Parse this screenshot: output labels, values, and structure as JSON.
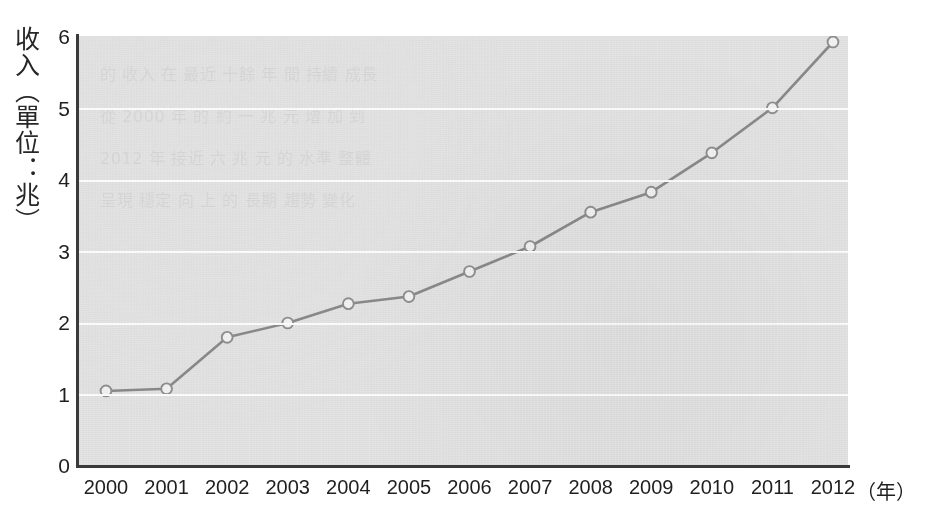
{
  "chart_data": {
    "type": "line",
    "title": "",
    "xlabel": "年",
    "xlabel_full": "（年）",
    "ylabel": "收入（單位：兆）",
    "categories": [
      "2000",
      "2001",
      "2002",
      "2003",
      "2004",
      "2005",
      "2006",
      "2007",
      "2008",
      "2009",
      "2010",
      "2011",
      "2012"
    ],
    "x": [
      2000,
      2001,
      2002,
      2003,
      2004,
      2005,
      2006,
      2007,
      2008,
      2009,
      2010,
      2011,
      2012
    ],
    "values": [
      1.05,
      1.08,
      1.8,
      2.0,
      2.27,
      2.37,
      2.72,
      3.07,
      3.55,
      3.83,
      4.38,
      5.01,
      5.93
    ],
    "series": [
      {
        "name": "收入",
        "values": [
          1.05,
          1.08,
          1.8,
          2.0,
          2.27,
          2.37,
          2.72,
          3.07,
          3.55,
          3.83,
          4.38,
          5.01,
          5.93
        ]
      }
    ],
    "xlim": [
      2000,
      2012
    ],
    "ylim": [
      0,
      6
    ],
    "yticks": [
      0,
      1,
      2,
      3,
      4,
      5,
      6
    ],
    "ytick_labels": [
      "0",
      "1",
      "2",
      "3",
      "4",
      "5",
      "6"
    ],
    "grid": true,
    "grid_axis": "y",
    "grid_color": "#fdfdfd",
    "legend": false,
    "legend_position": "none",
    "marker": "circle-open",
    "unit_note": "單位：兆"
  },
  "style": {
    "plot_background": "#e3e3e3",
    "page_background": "#ffffff",
    "line_color": "#8a8a8a",
    "marker_fill": "#f2f2f2",
    "marker_stroke": "#8f8f8f",
    "axis_color": "#3a3a3a",
    "text_color": "#1f1f1f"
  },
  "ghost_text": {
    "lines": [
      "的 收入 在 最近 十餘 年 間 持續 成長",
      "從 2000 年 的 約 一 兆 元 增 加 到",
      "2012 年 接近 六 兆 元 的 水準 整體",
      "呈現 穩定 向 上 的 長期 趨勢 變化"
    ]
  }
}
